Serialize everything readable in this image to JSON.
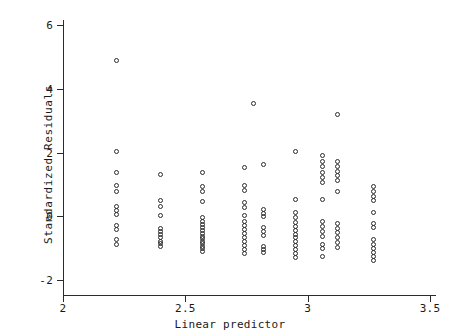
{
  "chart_data": {
    "type": "scatter",
    "title": "",
    "xlabel": "Linear predictor",
    "ylabel": "Standardized Residuals",
    "xlim": [
      2.0,
      3.5
    ],
    "ylim": [
      -2.6,
      6.4
    ],
    "xticks": [
      2,
      2.5,
      3,
      3.5
    ],
    "xtick_labels": [
      "2",
      "2.5",
      "3",
      "3.5"
    ],
    "yticks": [
      -2,
      0,
      2,
      4,
      6
    ],
    "ytick_labels": [
      "-2",
      "0",
      "2",
      "4",
      "6"
    ],
    "grid": false,
    "legend": null,
    "marker": "open-circle",
    "marker_color": "#2b2b2b",
    "points": [
      [
        2.22,
        4.9
      ],
      [
        2.22,
        2.02
      ],
      [
        2.22,
        1.38
      ],
      [
        2.22,
        0.95
      ],
      [
        2.22,
        0.78
      ],
      [
        2.22,
        0.3
      ],
      [
        2.22,
        0.18
      ],
      [
        2.22,
        0.05
      ],
      [
        2.22,
        -0.3
      ],
      [
        2.22,
        -0.42
      ],
      [
        2.22,
        -0.72
      ],
      [
        2.22,
        -0.88
      ],
      [
        2.4,
        1.32
      ],
      [
        2.4,
        0.48
      ],
      [
        2.4,
        0.3
      ],
      [
        2.4,
        0.02
      ],
      [
        2.4,
        -0.38
      ],
      [
        2.4,
        -0.48
      ],
      [
        2.4,
        -0.58
      ],
      [
        2.4,
        -0.68
      ],
      [
        2.4,
        -0.78
      ],
      [
        2.4,
        -0.86
      ],
      [
        2.4,
        -0.95
      ],
      [
        2.57,
        1.38
      ],
      [
        2.57,
        0.92
      ],
      [
        2.57,
        0.78
      ],
      [
        2.57,
        0.45
      ],
      [
        2.57,
        -0.05
      ],
      [
        2.57,
        -0.15
      ],
      [
        2.57,
        -0.25
      ],
      [
        2.57,
        -0.35
      ],
      [
        2.57,
        -0.45
      ],
      [
        2.57,
        -0.55
      ],
      [
        2.57,
        -0.62
      ],
      [
        2.57,
        -0.7
      ],
      [
        2.57,
        -0.78
      ],
      [
        2.57,
        -0.86
      ],
      [
        2.57,
        -0.94
      ],
      [
        2.57,
        -1.02
      ],
      [
        2.57,
        -1.1
      ],
      [
        2.74,
        1.52
      ],
      [
        2.74,
        0.98
      ],
      [
        2.74,
        0.82
      ],
      [
        2.74,
        0.42
      ],
      [
        2.74,
        0.28
      ],
      [
        2.74,
        0.02
      ],
      [
        2.74,
        -0.18
      ],
      [
        2.74,
        -0.3
      ],
      [
        2.74,
        -0.42
      ],
      [
        2.74,
        -0.55
      ],
      [
        2.74,
        -0.68
      ],
      [
        2.74,
        -0.8
      ],
      [
        2.74,
        -0.92
      ],
      [
        2.74,
        -1.04
      ],
      [
        2.74,
        -1.16
      ],
      [
        2.78,
        3.55
      ],
      [
        2.82,
        1.62
      ],
      [
        2.82,
        0.22
      ],
      [
        2.82,
        0.1
      ],
      [
        2.82,
        -0.02
      ],
      [
        2.82,
        -0.35
      ],
      [
        2.82,
        -0.48
      ],
      [
        2.82,
        -0.6
      ],
      [
        2.82,
        -0.95
      ],
      [
        2.82,
        -1.05
      ],
      [
        2.82,
        -1.15
      ],
      [
        2.95,
        2.02
      ],
      [
        2.95,
        0.52
      ],
      [
        2.95,
        0.12
      ],
      [
        2.95,
        -0.05
      ],
      [
        2.95,
        -0.2
      ],
      [
        2.95,
        -0.32
      ],
      [
        2.95,
        -0.44
      ],
      [
        2.95,
        -0.56
      ],
      [
        2.95,
        -0.68
      ],
      [
        2.95,
        -0.8
      ],
      [
        2.95,
        -0.92
      ],
      [
        2.95,
        -1.04
      ],
      [
        2.95,
        -1.16
      ],
      [
        2.95,
        -1.28
      ],
      [
        3.06,
        1.92
      ],
      [
        3.06,
        1.72
      ],
      [
        3.06,
        1.55
      ],
      [
        3.06,
        1.38
      ],
      [
        3.06,
        1.22
      ],
      [
        3.06,
        1.05
      ],
      [
        3.06,
        0.52
      ],
      [
        3.06,
        -0.18
      ],
      [
        3.06,
        -0.32
      ],
      [
        3.06,
        -0.48
      ],
      [
        3.06,
        -0.62
      ],
      [
        3.06,
        -0.88
      ],
      [
        3.06,
        -1.0
      ],
      [
        3.06,
        -1.25
      ],
      [
        3.12,
        3.2
      ],
      [
        3.12,
        1.72
      ],
      [
        3.12,
        1.55
      ],
      [
        3.12,
        1.4
      ],
      [
        3.12,
        1.28
      ],
      [
        3.12,
        1.12
      ],
      [
        3.12,
        0.78
      ],
      [
        3.12,
        -0.22
      ],
      [
        3.12,
        -0.38
      ],
      [
        3.12,
        -0.52
      ],
      [
        3.12,
        -0.68
      ],
      [
        3.12,
        -0.82
      ],
      [
        3.12,
        -0.98
      ],
      [
        3.27,
        0.92
      ],
      [
        3.27,
        0.78
      ],
      [
        3.27,
        0.62
      ],
      [
        3.27,
        0.48
      ],
      [
        3.27,
        0.12
      ],
      [
        3.27,
        -0.22
      ],
      [
        3.27,
        -0.36
      ],
      [
        3.27,
        -0.72
      ],
      [
        3.27,
        -0.88
      ],
      [
        3.27,
        -1.02
      ],
      [
        3.27,
        -1.14
      ],
      [
        3.27,
        -1.26
      ],
      [
        3.27,
        -1.38
      ]
    ]
  }
}
